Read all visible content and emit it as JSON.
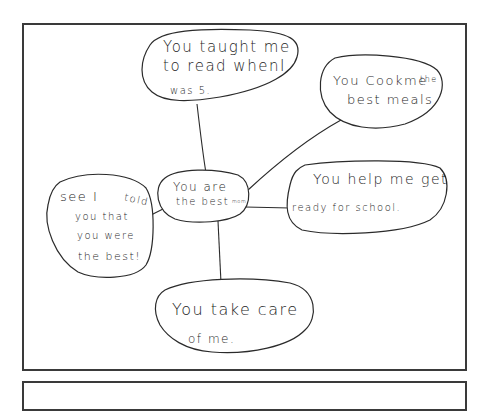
{
  "diagram": {
    "type": "mind-map",
    "style": "hand-drawn",
    "colors": {
      "ink": "#2b2b2b",
      "paper": "#ffffff",
      "frame": "#3a3a3a"
    },
    "center": {
      "id": "center",
      "lines": [
        "You are",
        "the best"
      ],
      "suffix": "mom"
    },
    "nodes": [
      {
        "id": "taught-read",
        "lines": [
          "You taught me",
          "to read whenI",
          "was 5."
        ]
      },
      {
        "id": "cook-meals",
        "lines": [
          "You Cookme",
          "best meals."
        ],
        "suffix": "the"
      },
      {
        "id": "help-school",
        "lines": [
          "You help me get",
          "ready for school."
        ]
      },
      {
        "id": "told-you",
        "lines": [
          "see I",
          "you that",
          "you were",
          "the best!"
        ],
        "suffix": "told"
      },
      {
        "id": "take-care",
        "lines": [
          "You take care",
          "of me."
        ]
      }
    ],
    "edges": [
      {
        "from": "center",
        "to": "taught-read"
      },
      {
        "from": "center",
        "to": "cook-meals"
      },
      {
        "from": "center",
        "to": "help-school"
      },
      {
        "from": "center",
        "to": "told-you"
      },
      {
        "from": "center",
        "to": "take-care"
      }
    ]
  }
}
